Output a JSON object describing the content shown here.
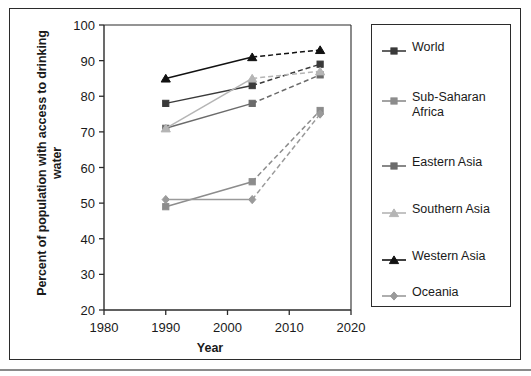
{
  "chart_data": {
    "type": "line",
    "title": "",
    "xlabel": "Year",
    "ylabel": "Percent of population with access to drinking water",
    "xlim": [
      1980,
      2020
    ],
    "ylim": [
      20,
      100
    ],
    "xticks": [
      "1980",
      "1990",
      "2000",
      "2010",
      "2020"
    ],
    "yticks": [
      "20",
      "30",
      "40",
      "50",
      "60",
      "70",
      "80",
      "90",
      "100"
    ],
    "x": [
      1990,
      2004,
      2015
    ],
    "grid": false,
    "legend_position": "right",
    "series": [
      {
        "name": "World",
        "values": [
          78,
          83,
          89
        ],
        "color": "#3a3a3a",
        "marker": "square"
      },
      {
        "name": "Sub-Saharan\nAfrica",
        "values": [
          49,
          56,
          76
        ],
        "color": "#8c8c8c",
        "marker": "square"
      },
      {
        "name": "Eastern Asia",
        "values": [
          71,
          78,
          86
        ],
        "color": "#6b6b6b",
        "marker": "square"
      },
      {
        "name": "Southern Asia",
        "values": [
          71,
          85,
          87
        ],
        "color": "#b5b5b5",
        "marker": "triangle"
      },
      {
        "name": "Western Asia",
        "values": [
          85,
          91,
          93
        ],
        "color": "#111111",
        "marker": "triangle"
      },
      {
        "name": "Oceania",
        "values": [
          51,
          51,
          75
        ],
        "color": "#9a9a9a",
        "marker": "diamond"
      }
    ]
  },
  "axes": {
    "x_title": "Year",
    "y_title": "Percent of population with access to\ndrinking water"
  }
}
